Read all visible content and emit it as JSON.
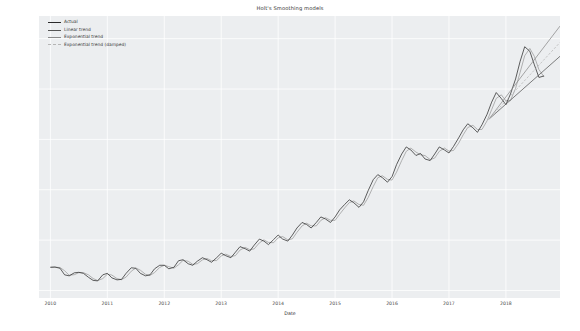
{
  "chart_data": {
    "type": "line",
    "title": "Holt's Smoothing models",
    "xlabel": "Date",
    "ylabel": "",
    "grid": true,
    "legend_position": "upper left",
    "xlim": [
      2009.8,
      2018.95
    ],
    "ylim": [
      170,
      1290
    ],
    "yticks": [
      200,
      400,
      600,
      800,
      1000,
      1200
    ],
    "xticks": [
      2010,
      2011,
      2012,
      2013,
      2014,
      2015,
      2016,
      2017,
      2018
    ],
    "colors": {
      "actual": "#2b2b2b",
      "linear": "#555555",
      "exponential": "#8a8a8a",
      "damped": "#b5b5b5",
      "plot_background": "#eceef0",
      "gridline": "#ffffff",
      "text": "#3a3a3a"
    },
    "series": [
      {
        "name": "Actual",
        "color": "#2b2b2b",
        "style": "solid",
        "x": [
          2010.0,
          2010.08,
          2010.17,
          2010.25,
          2010.33,
          2010.42,
          2010.5,
          2010.58,
          2010.67,
          2010.75,
          2010.83,
          2010.92,
          2011.0,
          2011.08,
          2011.17,
          2011.25,
          2011.33,
          2011.42,
          2011.5,
          2011.58,
          2011.67,
          2011.75,
          2011.83,
          2011.92,
          2012.0,
          2012.08,
          2012.17,
          2012.25,
          2012.33,
          2012.42,
          2012.5,
          2012.58,
          2012.67,
          2012.75,
          2012.83,
          2012.92,
          2013.0,
          2013.08,
          2013.17,
          2013.25,
          2013.33,
          2013.42,
          2013.5,
          2013.58,
          2013.67,
          2013.75,
          2013.83,
          2013.92,
          2014.0,
          2014.08,
          2014.17,
          2014.25,
          2014.33,
          2014.42,
          2014.5,
          2014.58,
          2014.67,
          2014.75,
          2014.83,
          2014.92,
          2015.0,
          2015.08,
          2015.17,
          2015.25,
          2015.33,
          2015.42,
          2015.5,
          2015.58,
          2015.67,
          2015.75,
          2015.83,
          2015.92,
          2016.0,
          2016.08,
          2016.17,
          2016.25,
          2016.33,
          2016.42,
          2016.5,
          2016.58,
          2016.67,
          2016.75,
          2016.83,
          2016.92,
          2017.0,
          2017.08,
          2017.17,
          2017.25,
          2017.33,
          2017.42,
          2017.5,
          2017.58,
          2017.67,
          2017.75,
          2017.83,
          2017.92,
          2018.0,
          2018.08,
          2018.17,
          2018.25,
          2018.33,
          2018.42,
          2018.5,
          2018.58,
          2018.67
        ],
        "y": [
          292,
          293,
          288,
          262,
          258,
          270,
          272,
          268,
          252,
          240,
          238,
          262,
          268,
          250,
          242,
          244,
          268,
          290,
          288,
          268,
          258,
          262,
          286,
          300,
          300,
          286,
          292,
          318,
          322,
          306,
          300,
          316,
          330,
          322,
          312,
          330,
          348,
          338,
          330,
          352,
          374,
          366,
          356,
          380,
          404,
          396,
          382,
          402,
          420,
          404,
          396,
          420,
          448,
          470,
          462,
          448,
          470,
          492,
          484,
          470,
          492,
          520,
          542,
          560,
          548,
          530,
          552,
          596,
          640,
          660,
          648,
          630,
          652,
          700,
          742,
          770,
          758,
          736,
          744,
          722,
          716,
          742,
          770,
          758,
          746,
          772,
          806,
          838,
          862,
          846,
          828,
          858,
          900,
          948,
          986,
          962,
          938,
          980,
          1040,
          1110,
          1168,
          1150,
          1096,
          1046,
          1052
        ]
      },
      {
        "name": "Linear trend",
        "color": "#555555",
        "style": "solid",
        "note": "fitted over history then straight forecast from 2017.7",
        "x_forecast": [
          2017.7,
          2018.95
        ],
        "y_forecast": [
          880,
          1130
        ]
      },
      {
        "name": "Exponential trend",
        "color": "#8a8a8a",
        "style": "solid",
        "x_forecast": [
          2017.7,
          2018.95
        ],
        "y_forecast": [
          880,
          1250
        ]
      },
      {
        "name": "Exponential trend (damped)",
        "color": "#b5b5b5",
        "style": "dashed",
        "x_forecast": [
          2017.7,
          2018.95
        ],
        "y_forecast": [
          880,
          1185
        ]
      }
    ]
  }
}
